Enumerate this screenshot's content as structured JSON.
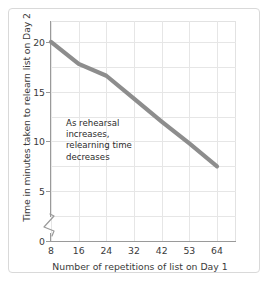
{
  "chart_data": {
    "type": "line",
    "title": "",
    "xlabel": "Number of repetitions of list on Day 1",
    "ylabel": "Time in minutes taken to relearn list on Day 2",
    "categories": [
      "8",
      "16",
      "24",
      "32",
      "42",
      "53",
      "64"
    ],
    "x": [
      8,
      16,
      24,
      32,
      42,
      53,
      64
    ],
    "values": [
      20,
      17.8,
      16.6,
      14.3,
      12,
      9.8,
      7.5
    ],
    "series": [
      {
        "name": "Relearning time",
        "values": [
          20,
          17.8,
          16.6,
          14.3,
          12,
          9.8,
          7.5
        ]
      }
    ],
    "ytick_labels": [
      "0",
      "5",
      "10",
      "15",
      "20"
    ],
    "yticks": [
      0,
      5,
      10,
      15,
      20
    ],
    "ylim": [
      0,
      22
    ],
    "xlim": [
      8,
      64
    ],
    "grid": true,
    "legend": false,
    "axis_break": true,
    "axis_break_axis": "y",
    "line_color": "#8d8d8d",
    "grid_color": "#e6e6e6",
    "axis_color": "#9a9a9a",
    "background_color": "#ffffff",
    "annotations": [
      {
        "text": "As rehearsal\nincreases,\nrelearning time\ndecreases",
        "x": 18,
        "y": 13.2
      }
    ]
  },
  "axis": {
    "x_title": "Number of repetitions of list on Day 1",
    "y_title": "Time in minutes taken to relearn list on Day 2"
  },
  "annotation": {
    "text": "As rehearsal\nincreases,\nrelearning time\ndecreases"
  }
}
